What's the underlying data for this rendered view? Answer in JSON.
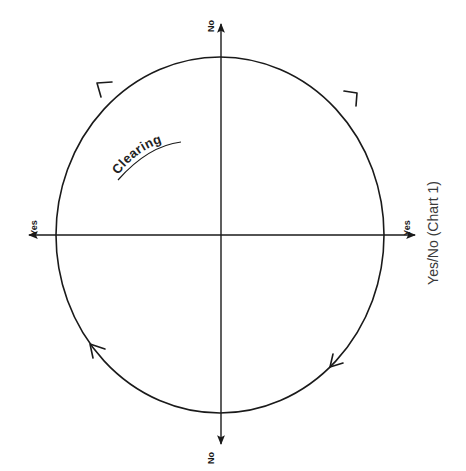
{
  "diagram": {
    "axes": {
      "top_label": "No",
      "bottom_label": "No",
      "left_label": "Yes",
      "right_label": "Yes"
    },
    "arc_label": "Clearing",
    "caption": "Yes/No (Chart 1)",
    "flow_direction": "clockwise",
    "arrows_on_circle": 4,
    "colors": {
      "stroke": "#1a1a1a",
      "background": "#ffffff"
    }
  }
}
